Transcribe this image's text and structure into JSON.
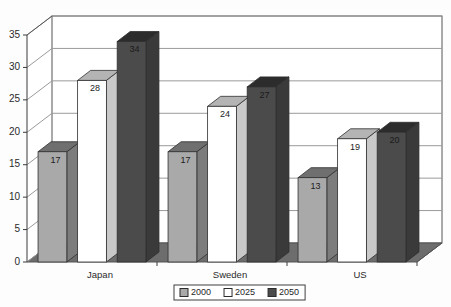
{
  "chart_data": {
    "type": "bar",
    "title": "",
    "subtitle": "",
    "xlabel": "",
    "ylabel": "",
    "categories": [
      "Japan",
      "Sweden",
      "US"
    ],
    "series": [
      {
        "name": "2000",
        "values": [
          17,
          17,
          13
        ],
        "color": "#a9a9a9"
      },
      {
        "name": "2025",
        "values": [
          28,
          24,
          19
        ],
        "color": "#ffffff"
      },
      {
        "name": "2050",
        "values": [
          34,
          27,
          20
        ],
        "color": "#4b4b4b"
      }
    ],
    "ylim": [
      0,
      35
    ],
    "yticks": [
      0,
      5,
      10,
      15,
      20,
      25,
      30,
      35
    ],
    "ytick_labels": [
      "0",
      "5",
      "10",
      "15",
      "20",
      "25",
      "30",
      "35"
    ],
    "grid": true,
    "legend_position": "bottom",
    "style": "3d-column",
    "annotations": [
      "data labels shown inside top of each column"
    ]
  },
  "legend": {
    "entries": [
      {
        "label": "2000",
        "swatch": "#a9a9a9"
      },
      {
        "label": "2025",
        "swatch": "#ffffff"
      },
      {
        "label": "2050",
        "swatch": "#4b4b4b"
      }
    ]
  },
  "colors": {
    "series_2000_front": "#a9a9a9",
    "series_2000_top": "#6f6f6f",
    "series_2000_side": "#7c7c7c",
    "series_2025_front": "#ffffff",
    "series_2025_top": "#b4b4b4",
    "series_2025_side": "#c9c9c9",
    "series_2050_front": "#4b4b4b",
    "series_2050_top": "#2c2c2c",
    "series_2050_side": "#3a3a3a",
    "floor": "#6d6d6d",
    "wall": "#ffffff",
    "gridline": "#9a9a9a",
    "frame": "#555555"
  }
}
